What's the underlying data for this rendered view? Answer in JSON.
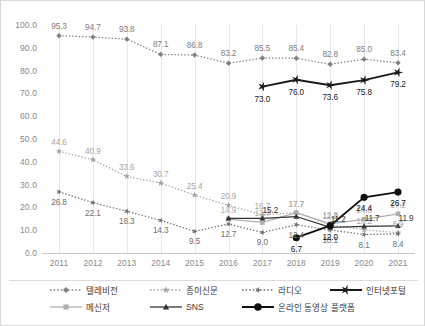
{
  "chart_data": {
    "type": "line",
    "title": "",
    "xlabel": "",
    "ylabel": "",
    "x": [
      "2011",
      "2012",
      "2013",
      "2014",
      "2015",
      "2016",
      "2017",
      "2018",
      "2019",
      "2020",
      "2021"
    ],
    "ylim": [
      0.0,
      100.0
    ],
    "yticks": [
      "0.0",
      "10.0",
      "20.0",
      "30.0",
      "40.0",
      "50.0",
      "60.0",
      "70.0",
      "80.0",
      "90.0",
      "100.0"
    ],
    "grid": "vertical",
    "legend_position": "bottom",
    "series": [
      {
        "name": "텔레비전",
        "color": "#808080",
        "marker": "diamond",
        "line": "dotted",
        "values": [
          95.3,
          94.7,
          93.8,
          87.1,
          86.8,
          83.2,
          85.5,
          85.4,
          82.8,
          85.0,
          83.4
        ],
        "labels": [
          "95.3",
          "94.7",
          "93.8",
          "87.1",
          "86.8",
          "83.2",
          "85.5",
          "85.4",
          "82.8",
          "85.0",
          "83.4"
        ]
      },
      {
        "name": "종이신문",
        "color": "#a6a6a6",
        "marker": "star",
        "line": "dotted",
        "values": [
          44.6,
          40.9,
          33.6,
          30.7,
          25.4,
          20.9,
          16.7,
          17.7,
          12.3,
          10.2,
          8.9
        ],
        "labels": [
          "44.6",
          "40.9",
          "33.6",
          "30.7",
          "25.4",
          "20.9",
          "16.7",
          "17.7",
          "12.3",
          "10.2",
          "8.9"
        ]
      },
      {
        "name": "라디오",
        "color": "#707070",
        "marker": "star-x",
        "line": "dotted",
        "values": [
          26.8,
          22.1,
          18.3,
          14.3,
          9.5,
          12.7,
          9.0,
          12.4,
          10.1,
          8.1,
          8.4
        ],
        "labels": [
          "26.8",
          "22.1",
          "18.3",
          "14.3",
          "9.5",
          "12.7",
          "9.0",
          "12.4",
          "10.1",
          "8.1",
          "8.4"
        ]
      },
      {
        "name": "인터넷포털",
        "color": "#1a1a1a",
        "marker": "bold-x",
        "line": "solid",
        "values": [
          null,
          null,
          null,
          null,
          null,
          null,
          73.0,
          76.0,
          73.6,
          75.8,
          79.2
        ],
        "labels": [
          "",
          "",
          "",
          "",
          "",
          "",
          "73.0",
          "76.0",
          "73.6",
          "75.8",
          "79.2"
        ]
      },
      {
        "name": "메신저",
        "color": "#b0b0b0",
        "marker": "square",
        "line": "solid",
        "values": [
          null,
          null,
          null,
          null,
          null,
          14.9,
          13.4,
          17.7,
          12.8,
          14.8,
          17.2
        ],
        "labels": [
          "",
          "",
          "",
          "",
          "",
          "14.9",
          "13.4",
          "17.7",
          "12.8",
          "14.8",
          "17.2"
        ]
      },
      {
        "name": "SNS",
        "color": "#333333",
        "marker": "triangle",
        "line": "solid",
        "values": [
          null,
          null,
          null,
          null,
          null,
          15.2,
          15.2,
          16.0,
          11.2,
          11.7,
          11.9
        ],
        "labels": [
          "",
          "",
          "",
          "",
          "",
          "",
          "15.2",
          "",
          "11.2",
          "11.7",
          "11.9"
        ]
      },
      {
        "name": "온라인 동영상 플랫폼",
        "color": "#111111",
        "marker": "circle",
        "line": "solid",
        "values": [
          null,
          null,
          null,
          null,
          null,
          null,
          null,
          6.7,
          12.0,
          24.4,
          26.7
        ],
        "labels": [
          "",
          "",
          "",
          "",
          "",
          "",
          "",
          "6.7",
          "12.0",
          "24.4",
          "26.7"
        ]
      }
    ],
    "legend": [
      {
        "label": "텔레비전"
      },
      {
        "label": "종이신문"
      },
      {
        "label": "라디오"
      },
      {
        "label": "인터넷포털"
      },
      {
        "label": "메신저"
      },
      {
        "label": "SNS"
      },
      {
        "label": "온라인 동영상 플랫폼"
      }
    ]
  }
}
